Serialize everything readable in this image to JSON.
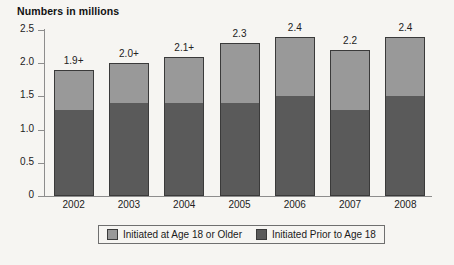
{
  "chart_data": {
    "type": "bar",
    "subtype": "stacked-bar",
    "title": "Numbers in millions",
    "xlabel": "",
    "ylabel": "",
    "ylim": [
      0,
      2.5
    ],
    "yticks": [
      "0",
      "0.5",
      "1.0",
      "1.5",
      "2.0",
      "2.5"
    ],
    "ytick_values": [
      0,
      0.5,
      1.0,
      1.5,
      2.0,
      2.5
    ],
    "grid": false,
    "legend_position": "bottom",
    "categories": [
      "2002",
      "2003",
      "2004",
      "2005",
      "2006",
      "2007",
      "2008"
    ],
    "series": [
      {
        "name": "Initiated Prior to Age 18",
        "color": "#5a5a5a",
        "values": [
          1.3,
          1.4,
          1.4,
          1.4,
          1.5,
          1.3,
          1.5
        ]
      },
      {
        "name": "Initiated at Age 18 or Older",
        "color": "#999999",
        "values": [
          0.6,
          0.6,
          0.7,
          0.9,
          0.9,
          0.9,
          0.9
        ]
      }
    ],
    "totals": [
      1.9,
      2.0,
      2.1,
      2.3,
      2.4,
      2.2,
      2.4
    ],
    "total_labels": [
      "1.9+",
      "2.0+",
      "2.1+",
      "2.3",
      "2.4",
      "2.2",
      "2.4"
    ]
  },
  "legend": {
    "items": [
      {
        "label": "Initiated at Age 18 or Older",
        "color": "#999999"
      },
      {
        "label": "Initiated Prior to Age 18",
        "color": "#5a5a5a"
      }
    ]
  },
  "colors": {
    "background": "#f6f5f2",
    "axis": "#8d8d8d",
    "bar_outline": "#3a3a3a",
    "light_segment": "#999999",
    "dark_segment": "#5a5a5a"
  }
}
